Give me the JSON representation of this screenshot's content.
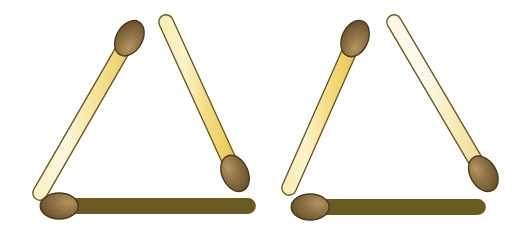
{
  "figure": {
    "background_color": "#ffffff",
    "width": 525,
    "height": 235
  },
  "palette": {
    "background": "#ffffff",
    "stick_light": "#fdf5d4",
    "stick_mid": "#f7e8a8",
    "stick_deep": "#f2d871",
    "stick_shadow": "#e8c85c",
    "stick_outline": "#6b5a22",
    "head_light": "#a98a55",
    "head_mid": "#8f7240",
    "head_deep": "#6f5628",
    "head_outline": "#4a3a18",
    "speckle": "#5d4820"
  },
  "groups": [
    {
      "name": "left-triangle",
      "label": "Left triangle",
      "matches": [
        {
          "name": "left-triangle-left-diagonal",
          "label": "Left diagonal matchstick",
          "x1": 133,
          "y1": 32,
          "x2": 40,
          "y2": 193,
          "head_end": "start",
          "head_tone": "deep",
          "stick_tone": "mid"
        },
        {
          "name": "left-triangle-right-diagonal",
          "label": "Right diagonal matchstick",
          "x1": 166,
          "y1": 22,
          "x2": 238,
          "y2": 180,
          "head_end": "end",
          "head_tone": "deep",
          "stick_tone": "deep"
        },
        {
          "name": "left-triangle-base",
          "label": "Bottom horizontal matchstick",
          "x1": 52,
          "y1": 206,
          "x2": 248,
          "y2": 206,
          "head_end": "start",
          "head_tone": "deep",
          "stick_tone": "mid"
        }
      ]
    },
    {
      "name": "right-triangle",
      "label": "Right triangle",
      "matches": [
        {
          "name": "right-triangle-left-diagonal",
          "label": "Left diagonal matchstick",
          "x1": 358,
          "y1": 32,
          "x2": 289,
          "y2": 188,
          "head_end": "start",
          "head_tone": "deep",
          "stick_tone": "deep"
        },
        {
          "name": "right-triangle-right-diagonal",
          "label": "Right diagonal matchstick",
          "x1": 394,
          "y1": 22,
          "x2": 487,
          "y2": 180,
          "head_end": "end",
          "head_tone": "deep",
          "stick_tone": "light"
        },
        {
          "name": "right-triangle-base",
          "label": "Bottom horizontal matchstick",
          "x1": 303,
          "y1": 207,
          "x2": 478,
          "y2": 207,
          "head_end": "start",
          "head_tone": "deep",
          "stick_tone": "light"
        }
      ]
    }
  ],
  "geometry": {
    "stick_width": 13,
    "head_rx": 13,
    "head_ry": 19,
    "outline_width": 1.4
  }
}
